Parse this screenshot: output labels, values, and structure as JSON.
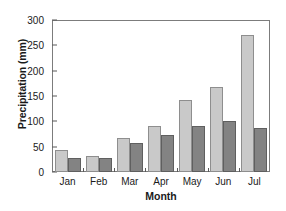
{
  "chart_data": {
    "type": "bar",
    "title": "",
    "xlabel": "Month",
    "ylabel": "Precipitation (mm)",
    "categories": [
      "Jan",
      "Feb",
      "Mar",
      "Apr",
      "May",
      "Jun",
      "Jul"
    ],
    "series": [
      {
        "name": "light-gray-series",
        "color": "#c9c9c9",
        "values": [
          44,
          32,
          67,
          91,
          142,
          168,
          270
        ]
      },
      {
        "name": "dark-gray-series",
        "color": "#838383",
        "values": [
          27,
          28,
          57,
          73,
          91,
          101,
          87
        ]
      }
    ],
    "ylim": [
      0,
      300
    ],
    "yticks": [
      0,
      50,
      100,
      150,
      200,
      250,
      300
    ],
    "ytick_labels": [
      "0",
      "50",
      "100",
      "150",
      "200",
      "250",
      "300"
    ],
    "grid": false,
    "legend": "none",
    "frame": "box"
  }
}
